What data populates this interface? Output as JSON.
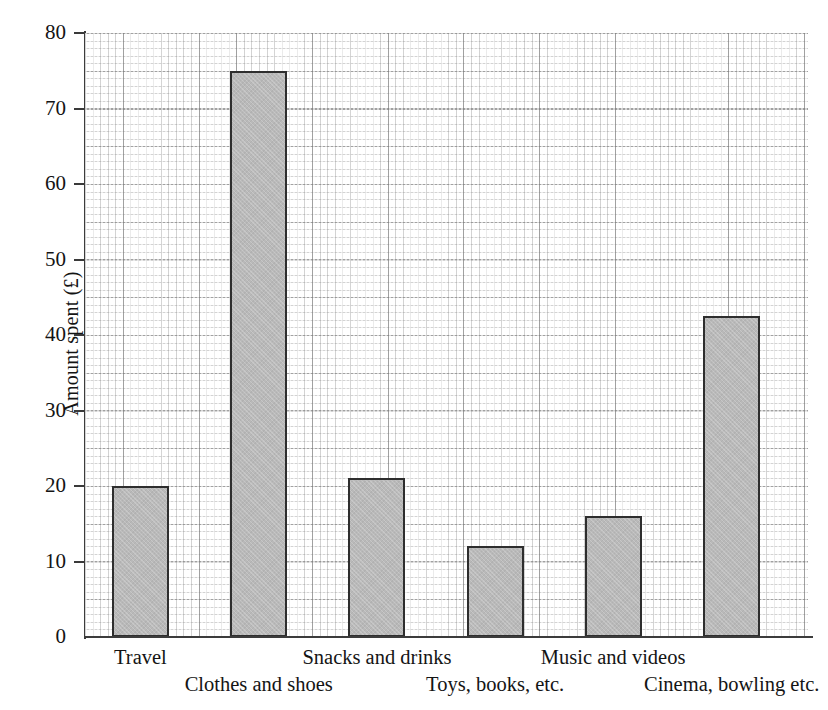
{
  "chart_data": {
    "type": "bar",
    "title": "",
    "subtitle": "",
    "xlabel": "",
    "ylabel": "Amount spent (£)",
    "categories": [
      "Travel",
      "Clothes and shoes",
      "Snacks and drinks",
      "Toys, books, etc.",
      "Music and videos",
      "Cinema, bowling etc."
    ],
    "values": [
      20,
      75,
      21,
      12,
      16,
      42.5
    ],
    "ylim": [
      0,
      80
    ],
    "xlim_units": [
      0,
      96
    ],
    "y_ticks": [
      0,
      10,
      20,
      30,
      40,
      50,
      60,
      70,
      80
    ],
    "y_tick_labels": [
      "0",
      "10",
      "20",
      "30",
      "40",
      "50",
      "60",
      "70",
      "80"
    ],
    "y_major_gridline_step": 5,
    "y_minor_gridline_step": 1,
    "grid": true,
    "grid_style": "dotted graph paper, major every 5 units",
    "legend": false,
    "legend_position": "none",
    "bar_fill_color": "#b9b9b9",
    "bar_edge_color": "#2e2e2e",
    "axis_color": "#3c3c3c",
    "background_color": "#ffffff",
    "label_layout": "staggered two rows"
  },
  "axis": {
    "y_title": "Amount spent (£)",
    "ticks": [
      {
        "label": "80",
        "value": 80
      },
      {
        "label": "70",
        "value": 70
      },
      {
        "label": "60",
        "value": 60
      },
      {
        "label": "50",
        "value": 50
      },
      {
        "label": "40",
        "value": 40
      },
      {
        "label": "30",
        "value": 30
      },
      {
        "label": "20",
        "value": 20
      },
      {
        "label": "10",
        "value": 10
      },
      {
        "label": "0",
        "value": 0
      }
    ]
  },
  "bars": [
    {
      "category": "Travel",
      "value": 20,
      "row": "top"
    },
    {
      "category": "Clothes and shoes",
      "value": 75,
      "row": "bottom"
    },
    {
      "category": "Snacks and drinks",
      "value": 21,
      "row": "top"
    },
    {
      "category": "Toys, books, etc.",
      "value": 12,
      "row": "bottom"
    },
    {
      "category": "Music and videos",
      "value": 16,
      "row": "top"
    },
    {
      "category": "Cinema, bowling etc.",
      "value": 42.5,
      "row": "bottom"
    }
  ]
}
